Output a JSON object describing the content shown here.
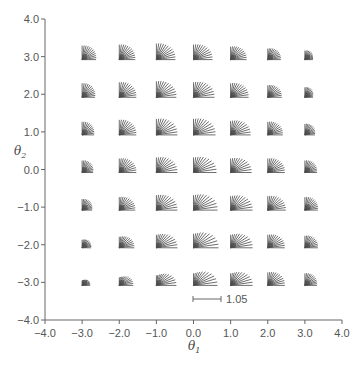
{
  "chart_data": {
    "type": "vector-field-fans",
    "title": "",
    "xlabel": "θ1",
    "ylabel": "θ2",
    "xlim": [
      -4.0,
      4.0
    ],
    "ylim": [
      -4.0,
      4.0
    ],
    "xticks": [
      "-4.0",
      "-3.0",
      "-2.0",
      "-1.0",
      "0.0",
      "1.0",
      "2.0",
      "3.0",
      "4.0"
    ],
    "yticks": [
      "4.0",
      "3.0",
      "2.0",
      "1.0",
      "0.0",
      "-1.0",
      "-2.0",
      "-3.0",
      "-4.0"
    ],
    "grid": false,
    "scale_bar": {
      "label": "1.05",
      "length_units": 0.75
    },
    "rays_per_fan": 12,
    "ray_angle_range_deg": [
      0,
      90
    ],
    "grid_x": [
      -3,
      -2,
      -1,
      0,
      1,
      2,
      3
    ],
    "grid_y": [
      3,
      2,
      1,
      0,
      -1,
      -2,
      -3
    ],
    "horizontal_length_px": [
      [
        14,
        16,
        19,
        19,
        16,
        13,
        8
      ],
      [
        13,
        17,
        20,
        21,
        18,
        14,
        8
      ],
      [
        12,
        17,
        21,
        22,
        20,
        15,
        10
      ],
      [
        11,
        17,
        21,
        23,
        21,
        17,
        12
      ],
      [
        10,
        16,
        21,
        24,
        22,
        18,
        13
      ],
      [
        9,
        15,
        21,
        25,
        22,
        17,
        13
      ],
      [
        8,
        14,
        20,
        24,
        22,
        17,
        12
      ]
    ],
    "vertical_length_px": [
      [
        14,
        15,
        16,
        15,
        13,
        11,
        9
      ],
      [
        14,
        15,
        16,
        15,
        14,
        12,
        10
      ],
      [
        13,
        15,
        16,
        16,
        14,
        13,
        11
      ],
      [
        12,
        14,
        15,
        15,
        14,
        14,
        12
      ],
      [
        11,
        13,
        15,
        15,
        14,
        14,
        13
      ],
      [
        8,
        11,
        13,
        14,
        13,
        13,
        12
      ],
      [
        5,
        8,
        10,
        12,
        12,
        13,
        12
      ]
    ],
    "legend": []
  }
}
